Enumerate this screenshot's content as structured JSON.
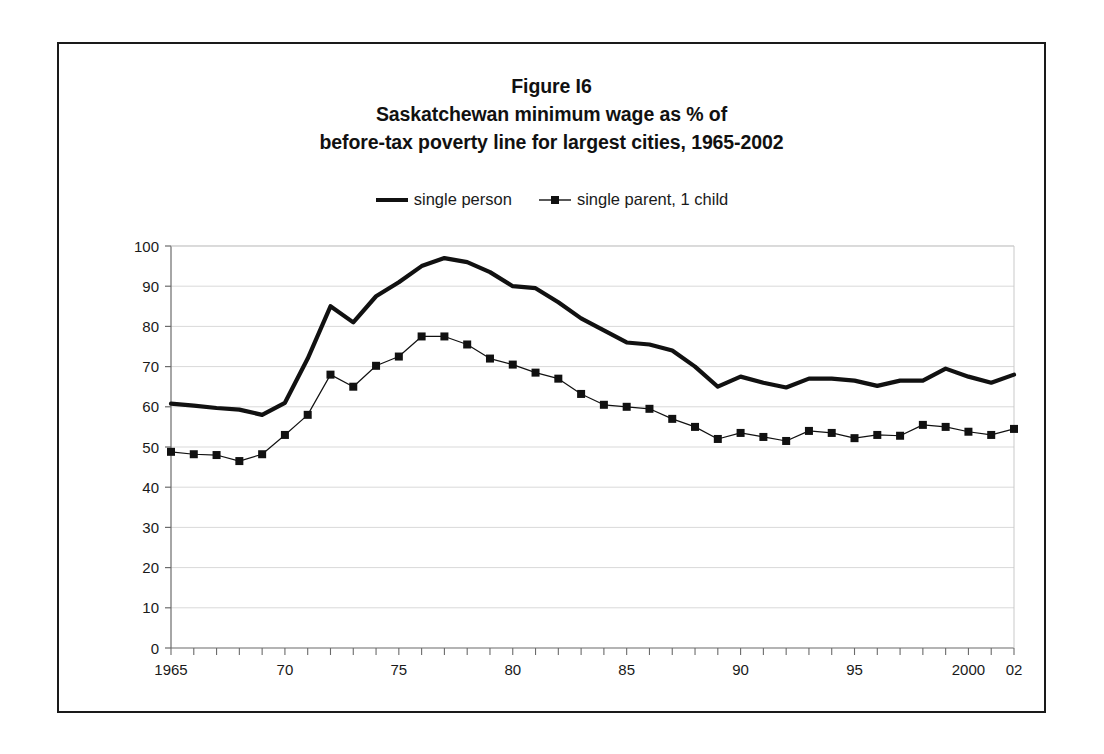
{
  "figure": {
    "title_lines": [
      "Figure I6",
      "Saskatchewan minimum wage as % of",
      "before-tax poverty line for largest cities, 1965-2002"
    ],
    "border_color": "#1a1a1a",
    "background": "#ffffff"
  },
  "legend": {
    "position": "top-center",
    "entries": [
      {
        "label": "single person",
        "key": "thick-line",
        "color": "#111111"
      },
      {
        "label": "single parent, 1 child",
        "key": "thin-line-square-marker",
        "color": "#111111"
      }
    ]
  },
  "chart_data": {
    "type": "line",
    "xlabel": "",
    "ylabel": "",
    "ylim": [
      0,
      100
    ],
    "ytick_step": 10,
    "yticks": [
      0,
      10,
      20,
      30,
      40,
      50,
      60,
      70,
      80,
      90,
      100
    ],
    "grid": true,
    "grid_color": "#d9d9d9",
    "xlim": [
      1965,
      2002
    ],
    "x": [
      1965,
      1966,
      1967,
      1968,
      1969,
      1970,
      1971,
      1972,
      1973,
      1974,
      1975,
      1976,
      1977,
      1978,
      1979,
      1980,
      1981,
      1982,
      1983,
      1984,
      1985,
      1986,
      1987,
      1988,
      1989,
      1990,
      1991,
      1992,
      1993,
      1994,
      1995,
      1996,
      1997,
      1998,
      1999,
      2000,
      2001,
      2002
    ],
    "xtick_labels": [
      {
        "x": 1965,
        "label": "1965"
      },
      {
        "x": 1970,
        "label": "70"
      },
      {
        "x": 1975,
        "label": "75"
      },
      {
        "x": 1980,
        "label": "80"
      },
      {
        "x": 1985,
        "label": "85"
      },
      {
        "x": 1990,
        "label": "90"
      },
      {
        "x": 1995,
        "label": "95"
      },
      {
        "x": 2000,
        "label": "2000"
      },
      {
        "x": 2002,
        "label": "02"
      }
    ],
    "series": [
      {
        "name": "single person",
        "style": "thick-line",
        "marker": "none",
        "color": "#111111",
        "values": [
          60.8,
          60.3,
          59.7,
          59.3,
          58.0,
          61.0,
          72.0,
          85.0,
          81.0,
          87.5,
          91.0,
          95.0,
          97.0,
          96.0,
          93.5,
          90.0,
          89.5,
          86.0,
          82.0,
          79.0,
          76.0,
          75.5,
          74.0,
          70.0,
          65.0,
          67.5,
          66.0,
          64.8,
          67.0,
          67.0,
          66.5,
          65.2,
          66.5,
          66.5,
          69.5,
          67.5,
          66.0,
          68.0
        ]
      },
      {
        "name": "single parent, 1 child",
        "style": "thin-line",
        "marker": "square",
        "color": "#111111",
        "values": [
          48.8,
          48.2,
          48.0,
          46.5,
          48.2,
          53.0,
          58.0,
          68.0,
          65.0,
          70.2,
          72.5,
          77.5,
          77.5,
          75.5,
          72.0,
          70.5,
          68.5,
          67.0,
          63.2,
          60.5,
          60.0,
          59.5,
          57.0,
          55.0,
          52.0,
          53.5,
          52.5,
          51.5,
          54.0,
          53.5,
          52.2,
          53.0,
          52.8,
          55.5,
          55.0,
          53.8,
          53.0,
          54.5
        ]
      }
    ]
  }
}
